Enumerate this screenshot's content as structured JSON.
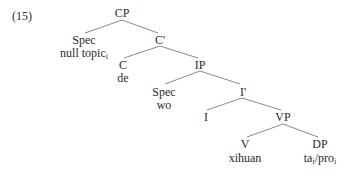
{
  "example_number": "(15)",
  "nodes": {
    "cp": {
      "label": "CP"
    },
    "spec_cp": {
      "label": "Spec",
      "word": "null topic",
      "sub": "i"
    },
    "c_bar": {
      "label": "C'"
    },
    "c": {
      "label": "C",
      "word": "de"
    },
    "ip": {
      "label": "IP"
    },
    "spec_ip": {
      "label": "Spec",
      "word": "wo"
    },
    "i_bar": {
      "label": "I'"
    },
    "i": {
      "label": "I"
    },
    "vp": {
      "label": "VP"
    },
    "v": {
      "label": "V",
      "word": "xihuan"
    },
    "dp": {
      "label": "DP",
      "word_a": "ta",
      "sub_a": "i",
      "slash": "/",
      "word_b": "pro",
      "sub_b": "i"
    }
  }
}
